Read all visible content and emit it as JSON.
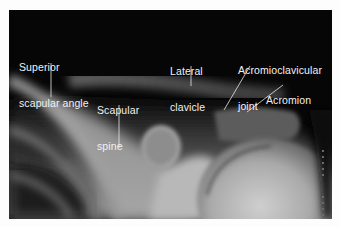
{
  "figure": {
    "colors": {
      "background": "#fdfdfd",
      "image_dark": "#050505",
      "label_text": "#f2f2f2",
      "leader_line": "#e8e8e8"
    },
    "labels": [
      {
        "id": "superior-scapular-angle",
        "line1": "Superior",
        "line2": "scapular angle"
      },
      {
        "id": "scapular-spine",
        "line1": "Scapular",
        "line2": "spine"
      },
      {
        "id": "lateral-clavicle",
        "line1": "Lateral",
        "line2": "clavicle"
      },
      {
        "id": "acromioclavicular-joint",
        "line1": "Acromioclavicular",
        "line2": "joint"
      },
      {
        "id": "acromion",
        "line1": "Acromion",
        "line2": ""
      }
    ]
  }
}
